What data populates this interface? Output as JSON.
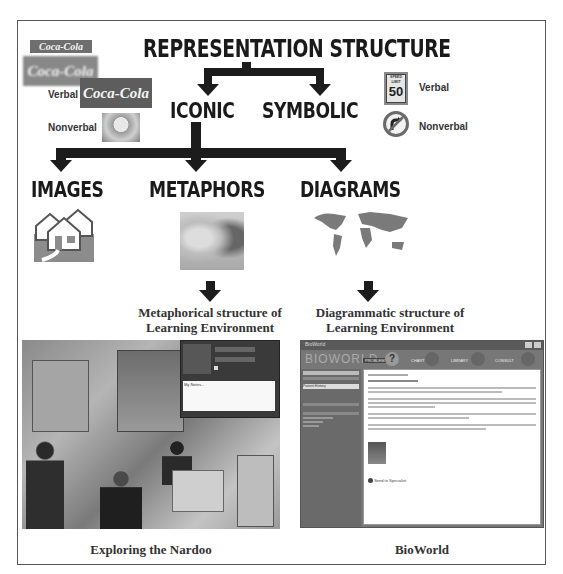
{
  "title": "REPRESENTATION STRUCTURE",
  "level1": {
    "iconic": "ICONIC",
    "symbolic": "SYMBOLIC"
  },
  "level2": {
    "images": "IMAGES",
    "metaphors": "METAPHORS",
    "diagrams": "DIAGRAMS"
  },
  "iconic_examples": {
    "verbal_label": "Verbal",
    "nonverbal_label": "Nonverbal",
    "logo_text": "Coca-Cola"
  },
  "symbolic_examples": {
    "verbal_label": "Verbal",
    "nonverbal_label": "Nonverbal",
    "sign_top": "SPEED LIMIT",
    "sign_value": "50"
  },
  "captions": {
    "metaphorical": "Metaphorical structure of",
    "metaphorical_2": "Learning Environment",
    "diagrammatic": "Diagrammatic structure of",
    "diagrammatic_2": "Learning Environment",
    "nardoo": "Exploring the Nardoo",
    "bioworld": "BioWorld"
  },
  "bioworld_ui": {
    "window_title": "BioWorld",
    "logo": "BIOWORLD",
    "nav": [
      "PROBLEM",
      "CHART",
      "LIBRARY",
      "CONSULT"
    ],
    "sidebar_field": "Patient History",
    "footer_link": "Send to Specialist"
  },
  "nardoo_ui": {
    "notes_text": "My Notes..."
  },
  "colors": {
    "frame": "#555555",
    "arrow": "#1c1c1c",
    "text": "#1a1a1a"
  }
}
